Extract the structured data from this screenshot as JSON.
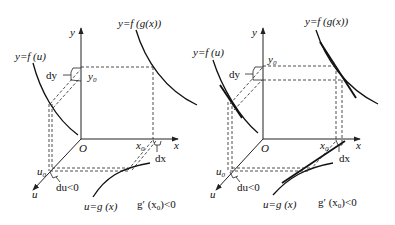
{
  "panels": [
    {
      "id": "left",
      "labels": {
        "y_axis": "y",
        "x_axis": "x",
        "u_axis": "u",
        "origin": "O",
        "fu": "y=f (u)",
        "fgx": "y=f (g(x))",
        "gx": "u=g (x)",
        "y0": "y",
        "y0_sub": "0",
        "x0": "x",
        "x0_sub": "0",
        "u0": "u",
        "u0_sub": "0",
        "dy": "dy",
        "dx": "dx",
        "du": "du<0",
        "deriv": "g′ (x",
        "deriv_sub": "0",
        "deriv_tail": ")<0"
      }
    },
    {
      "id": "right",
      "labels": {
        "y_axis": "y",
        "x_axis": "x",
        "u_axis": "u",
        "origin": "O",
        "fu": "y=f (u)",
        "fgx": "y=f (g(x))",
        "gx": "u=g (x)",
        "y0": "y",
        "y0_sub": "0",
        "x0": "x",
        "x0_sub": "0",
        "u0": "u",
        "u0_sub": "0",
        "dy": "dy",
        "dx": "dx",
        "du": "du<0",
        "deriv": "g′ (x",
        "deriv_sub": "0",
        "deriv_tail": ")<0"
      }
    }
  ]
}
